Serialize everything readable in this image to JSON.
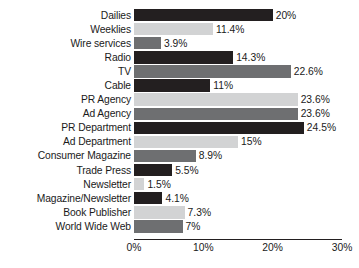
{
  "chart_data": {
    "type": "bar",
    "orientation": "horizontal",
    "title": "",
    "subtitle": "",
    "xlabel": "",
    "ylabel": "",
    "xlim": [
      0,
      30
    ],
    "xticks": [
      "0%",
      "10%",
      "20%",
      "30%"
    ],
    "xtick_values": [
      0,
      10,
      20,
      30
    ],
    "grid": false,
    "legend": "none",
    "value_label_suffix": "%",
    "categories": [
      "Dailies",
      "Weeklies",
      "Wire services",
      "Radio",
      "TV",
      "Cable",
      "PR Agency",
      "Ad Agency",
      "PR Department",
      "Ad Department",
      "Consumer Magazine",
      "Trade Press",
      "Newsletter",
      "Magazine/Newsletter",
      "Book Publisher",
      "World Wide Web"
    ],
    "values": [
      20,
      11.4,
      3.9,
      14.3,
      22.6,
      11,
      23.6,
      23.6,
      24.5,
      15,
      8.9,
      5.5,
      1.5,
      4.1,
      7.3,
      7
    ],
    "value_labels": [
      "20%",
      "11.4%",
      "3.9%",
      "14.3%",
      "22.6%",
      "11%",
      "23.6%",
      "23.6%",
      "24.5%",
      "15%",
      "8.9%",
      "5.5%",
      "1.5%",
      "4.1%",
      "7.3%",
      "7%"
    ],
    "bar_shades": [
      "dark",
      "light",
      "medium",
      "dark",
      "medium",
      "dark",
      "light",
      "medium",
      "dark",
      "light",
      "medium",
      "dark",
      "light",
      "dark",
      "light",
      "medium"
    ],
    "colors": {
      "dark": "#231f20",
      "light": "#d2d3d4",
      "medium": "#6e6f71",
      "axis": "#231f20",
      "text": "#1a1a1a",
      "background": "#ffffff"
    }
  }
}
